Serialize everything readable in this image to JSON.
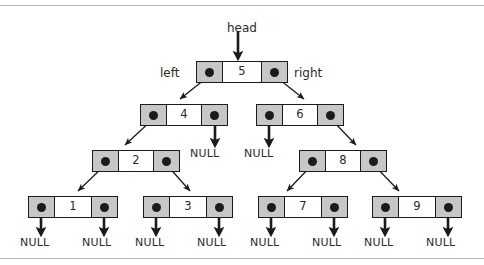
{
  "figure": {
    "title_labels": {
      "head": "head",
      "left": "left",
      "right": "right"
    },
    "null_label": "NULL",
    "colors": {
      "pointer_cell": "#c7c7c7",
      "value_cell": "#ffffff",
      "border": "#1b1b1b",
      "text": "#2b2b2b",
      "frame_rule": "#b9b9bc",
      "background": "#ffffff"
    }
  },
  "tree": {
    "type": "binary-search-tree",
    "nodes": [
      {
        "id": "n5",
        "value": "5",
        "level": 0,
        "x": 196,
        "y": 61,
        "width": 92
      },
      {
        "id": "n4",
        "value": "4",
        "level": 1,
        "x": 140,
        "y": 104,
        "width": 88
      },
      {
        "id": "n6",
        "value": "6",
        "level": 1,
        "x": 256,
        "y": 104,
        "width": 88
      },
      {
        "id": "n2",
        "value": "2",
        "level": 2,
        "x": 92,
        "y": 150,
        "width": 88
      },
      {
        "id": "n8",
        "value": "8",
        "level": 2,
        "x": 299,
        "y": 150,
        "width": 88
      },
      {
        "id": "n1",
        "value": "1",
        "level": 3,
        "x": 28,
        "y": 196,
        "width": 90
      },
      {
        "id": "n3",
        "value": "3",
        "level": 3,
        "x": 143,
        "y": 196,
        "width": 90
      },
      {
        "id": "n7",
        "value": "7",
        "level": 3,
        "x": 258,
        "y": 196,
        "width": 90
      },
      {
        "id": "n9",
        "value": "9",
        "level": 3,
        "x": 372,
        "y": 196,
        "width": 90
      }
    ],
    "null_terminators": [
      {
        "id": "null-n4-right",
        "x": 206,
        "y": 150
      },
      {
        "id": "null-n6-left",
        "x": 266,
        "y": 150
      },
      {
        "id": "null-n1-left",
        "x": 38,
        "y": 239
      },
      {
        "id": "null-n1-right",
        "x": 95,
        "y": 239
      },
      {
        "id": "null-n3-left",
        "x": 153,
        "y": 239
      },
      {
        "id": "null-n3-right",
        "x": 210,
        "y": 239
      },
      {
        "id": "null-n7-left",
        "x": 268,
        "y": 239
      },
      {
        "id": "null-n7-right",
        "x": 325,
        "y": 239
      },
      {
        "id": "null-n9-left",
        "x": 382,
        "y": 239
      },
      {
        "id": "null-n9-right",
        "x": 439,
        "y": 239
      }
    ],
    "annotations": [
      {
        "id": "head",
        "text": "head",
        "x": 227,
        "y": 22
      },
      {
        "id": "left",
        "text": "left",
        "x": 160,
        "y": 67
      },
      {
        "id": "right",
        "text": "right",
        "x": 294,
        "y": 67
      }
    ]
  }
}
